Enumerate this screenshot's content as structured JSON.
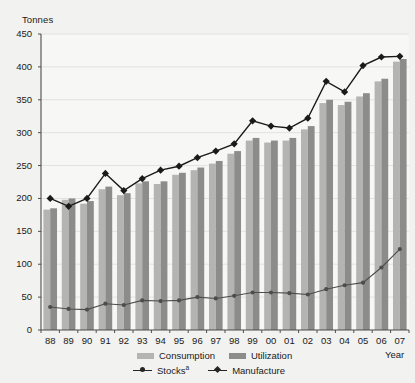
{
  "chart_data": {
    "type": "bar",
    "title": "",
    "ylabel": "Tonnes",
    "xlabel": "Year",
    "ylim": [
      0,
      450
    ],
    "ytick_step": 50,
    "yticks": [
      0,
      50,
      100,
      150,
      200,
      250,
      300,
      350,
      400,
      450
    ],
    "grid": true,
    "legend_position": "bottom",
    "categories": [
      "88",
      "89",
      "90",
      "91",
      "92",
      "93",
      "94",
      "95",
      "96",
      "97",
      "98",
      "99",
      "00",
      "01",
      "02",
      "03",
      "04",
      "05",
      "06",
      "07"
    ],
    "series": [
      {
        "name": "Consumption",
        "type": "bar",
        "color": "#b4b4b2",
        "values": [
          183,
          198,
          192,
          214,
          205,
          223,
          222,
          236,
          243,
          253,
          268,
          288,
          285,
          288,
          305,
          345,
          342,
          355,
          378,
          408
        ]
      },
      {
        "name": "Utilization",
        "type": "bar",
        "color": "#8c8c8a",
        "values": [
          185,
          200,
          196,
          218,
          208,
          226,
          226,
          239,
          247,
          257,
          272,
          292,
          288,
          292,
          310,
          350,
          347,
          360,
          382,
          412
        ]
      },
      {
        "name": "Stocks",
        "name_superscript": "a",
        "type": "line",
        "marker": "circle",
        "color": "#4d4d4d",
        "values": [
          35,
          32,
          31,
          40,
          38,
          45,
          44,
          45,
          50,
          48,
          52,
          57,
          57,
          56,
          54,
          62,
          68,
          72,
          95,
          123
        ]
      },
      {
        "name": "Manufacture",
        "type": "line",
        "marker": "diamond",
        "color": "#1a1a1a",
        "values": [
          200,
          188,
          200,
          238,
          212,
          230,
          243,
          249,
          262,
          272,
          283,
          318,
          310,
          307,
          322,
          378,
          362,
          402,
          415,
          416
        ]
      }
    ]
  },
  "legend": [
    {
      "key": "consumption",
      "label": "Consumption"
    },
    {
      "key": "utilization",
      "label": "Utilization"
    },
    {
      "key": "stocks",
      "label": "Stocks",
      "superscript": "a"
    },
    {
      "key": "manufacture",
      "label": "Manufacture"
    }
  ]
}
